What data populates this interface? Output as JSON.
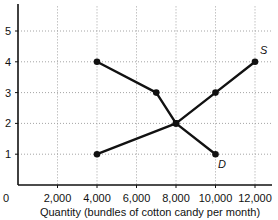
{
  "chart_data": {
    "type": "line",
    "title": "",
    "xlabel": "Quantity (bundles of cotton candy per month)",
    "ylabel": "",
    "x_ticks": [
      0,
      2000,
      4000,
      6000,
      8000,
      10000,
      12000
    ],
    "x_tick_labels": [
      "0",
      "2,000",
      "4,000",
      "6,000",
      "8,000",
      "10,000",
      "12,000"
    ],
    "y_ticks": [
      1,
      2,
      3,
      4,
      5
    ],
    "y_tick_labels": [
      "1",
      "2",
      "3",
      "4",
      "5"
    ],
    "xlim": [
      0,
      12800
    ],
    "ylim": [
      0,
      6
    ],
    "grid": true,
    "series": [
      {
        "name": "D",
        "label": "D",
        "points": [
          [
            4000,
            4
          ],
          [
            7000,
            3
          ],
          [
            8000,
            2
          ],
          [
            10000,
            1
          ]
        ]
      },
      {
        "name": "S",
        "label": "S",
        "points": [
          [
            4000,
            1
          ],
          [
            8000,
            2
          ],
          [
            10000,
            3
          ],
          [
            12000,
            4
          ]
        ]
      }
    ],
    "annotations": [
      {
        "text": "S",
        "x": 12000,
        "y": 4
      },
      {
        "text": "D",
        "x": 10000,
        "y": 1
      }
    ]
  },
  "labels": {
    "origin": "0",
    "x_axis_title": "Quantity (bundles of cotton candy per month)",
    "supply": "S",
    "demand": "D"
  }
}
